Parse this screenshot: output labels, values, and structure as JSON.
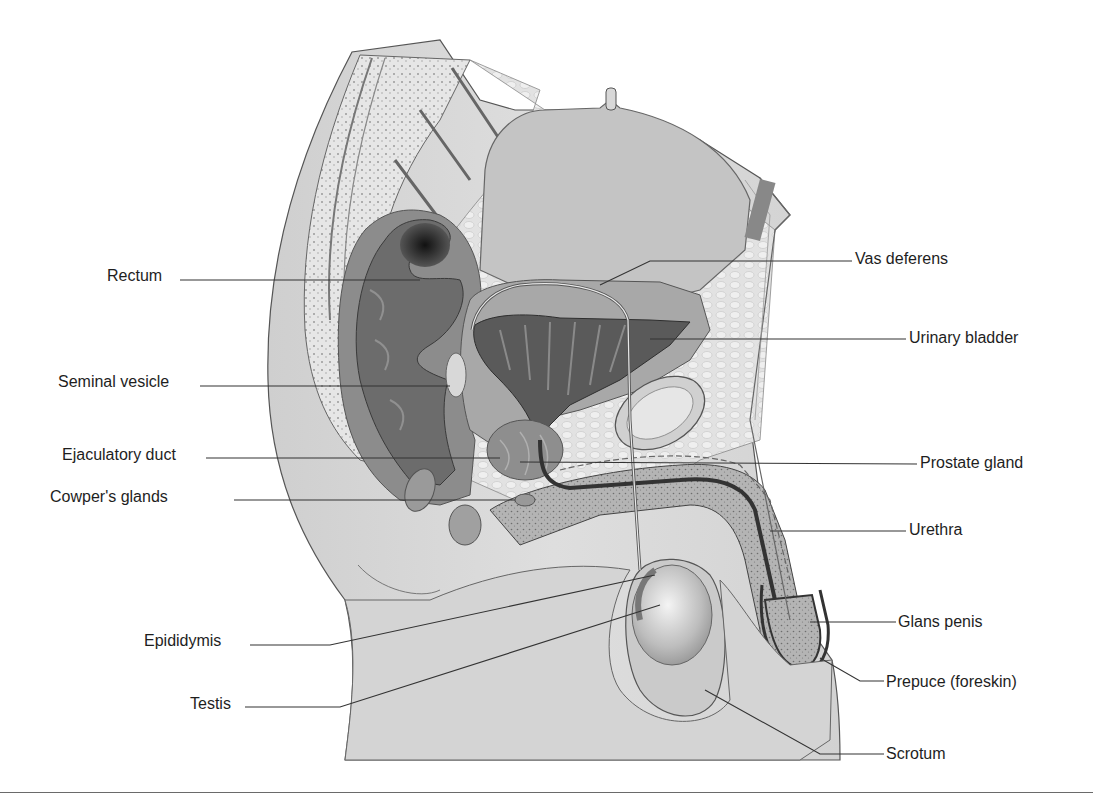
{
  "diagram": {
    "labels_left": [
      {
        "text": "Rectum",
        "x": 107,
        "y": 267
      },
      {
        "text": "Seminal vesicle",
        "x": 58,
        "y": 373
      },
      {
        "text": "Ejaculatory duct",
        "x": 62,
        "y": 446
      },
      {
        "text": "Cowper's glands",
        "x": 50,
        "y": 488
      },
      {
        "text": "Epididymis",
        "x": 144,
        "y": 632
      },
      {
        "text": "Testis",
        "x": 190,
        "y": 695
      }
    ],
    "labels_right": [
      {
        "text": "Vas deferens",
        "x": 855,
        "y": 250
      },
      {
        "text": "Urinary bladder",
        "x": 909,
        "y": 329
      },
      {
        "text": "Prostate gland",
        "x": 920,
        "y": 454
      },
      {
        "text": "Urethra",
        "x": 909,
        "y": 521
      },
      {
        "text": "Glans penis",
        "x": 898,
        "y": 613
      },
      {
        "text": "Prepuce (foreskin)",
        "x": 886,
        "y": 673
      },
      {
        "text": "Scrotum",
        "x": 886,
        "y": 745
      }
    ],
    "colors": {
      "background": "#ffffff",
      "tissue_light": "#dcdcdc",
      "tissue_mid": "#b8b8b8",
      "tissue_dark": "#6e6e6e",
      "lumen_dark": "#2a2a2a",
      "leader_line": "#333333",
      "text": "#1e1e1e"
    }
  }
}
